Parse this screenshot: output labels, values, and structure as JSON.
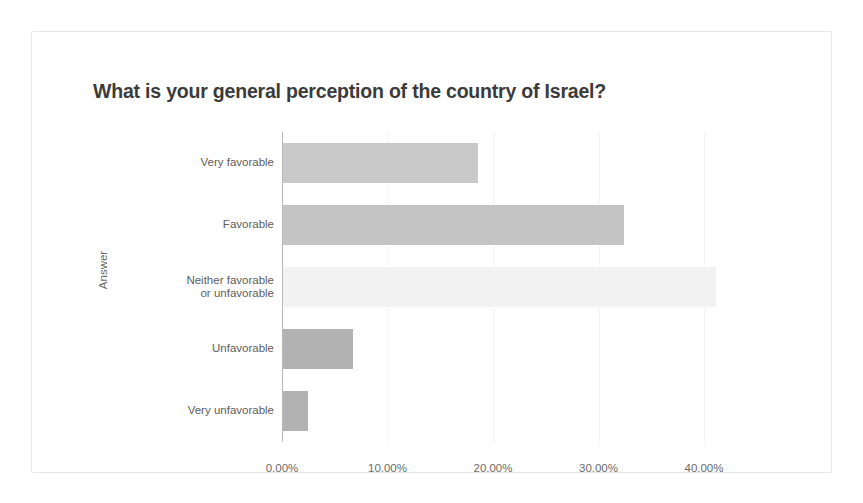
{
  "chart_data": {
    "type": "bar",
    "orientation": "horizontal",
    "title": "What is your general perception of the country of Israel?",
    "xlabel": "",
    "ylabel": "Answer",
    "categories": [
      "Very favorable",
      "Favorable",
      "Neither favorable\nor unfavorable",
      "Unfavorable",
      "Very unfavorable"
    ],
    "values": [
      18.5,
      32.3,
      41.0,
      6.6,
      2.4
    ],
    "bar_colors": [
      "#c9c9c9",
      "#c4c4c4",
      "#f2f2f2",
      "#b2b2b2",
      "#b2b2b2"
    ],
    "xlim": [
      0,
      41
    ],
    "xticks": [
      0,
      10,
      20,
      30,
      40
    ],
    "xtick_labels": [
      "0.00%",
      "10.00%",
      "20.00%",
      "30.00%",
      "40.00%"
    ],
    "grid": true,
    "legend": "none"
  },
  "frame": {
    "border_color": "#e6e6e6",
    "background": "#ffffff"
  }
}
